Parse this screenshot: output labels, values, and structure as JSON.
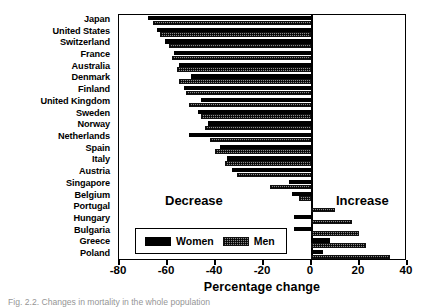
{
  "chart_data": {
    "type": "bar",
    "orientation": "horizontal",
    "title": "",
    "xlabel": "Percentage change",
    "ylabel": "",
    "xlim": [
      -80,
      40
    ],
    "xticks": [
      -80,
      -60,
      -40,
      -20,
      0,
      20,
      40
    ],
    "xticklabels": [
      "-80",
      "-60",
      "-40",
      "-20",
      "0",
      "20",
      "40"
    ],
    "grid": false,
    "legend_position": "lower-left",
    "categories": [
      "Japan",
      "United States",
      "Switzerland",
      "France",
      "Australia",
      "Denmark",
      "Finland",
      "United Kingdom",
      "Sweden",
      "Norway",
      "Netherlands",
      "Spain",
      "Italy",
      "Austria",
      "Singapore",
      "Belgium",
      "Portugal",
      "Hungary",
      "Bulgaria",
      "Greece",
      "Poland"
    ],
    "series": [
      {
        "name": "Women",
        "color": "#000000",
        "values": [
          -68,
          -64,
          -61,
          -57,
          -55,
          -50,
          -53,
          -46,
          -47,
          -43,
          -51,
          -38,
          -35,
          -33,
          -9,
          -8,
          1,
          -7,
          -7,
          8,
          5
        ]
      },
      {
        "name": "Men",
        "color": "#8a8a8a",
        "values": [
          -66,
          -63,
          -59,
          -58,
          -56,
          -55,
          -52,
          -51,
          -46,
          -44,
          -42,
          -40,
          -36,
          -31,
          -17,
          -5,
          10,
          17,
          20,
          23,
          33
        ]
      }
    ],
    "annotations": [
      {
        "text": "Decrease",
        "region": "left"
      },
      {
        "text": "Increase",
        "region": "right"
      }
    ]
  },
  "legend": {
    "items": [
      {
        "label": "Women",
        "swatch": "solid-black"
      },
      {
        "label": "Men",
        "swatch": "hatched-gray"
      }
    ]
  },
  "caption": {
    "text": "Fig. 2.2. Changes in mortality in the whole population"
  }
}
